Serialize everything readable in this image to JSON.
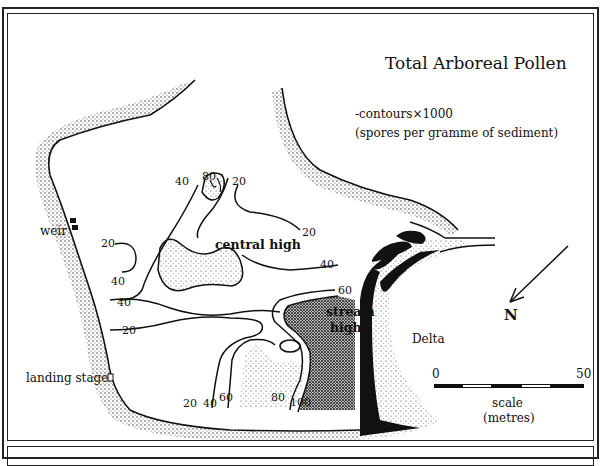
{
  "map": {
    "title": "Total Arboreal Pollen",
    "subtitle_line1": "-contours×1000",
    "subtitle_line2": "(spores per gramme of sediment)",
    "labels": {
      "weir": "weir",
      "landing_stage": "landing stage",
      "central_high": "central high",
      "stream_high_line1": "stream",
      "stream_high_line2": "high",
      "delta": "Delta"
    },
    "contour_labels": [
      {
        "id": "c40-top",
        "value": "40"
      },
      {
        "id": "c80-top",
        "value": "80"
      },
      {
        "id": "c20-top",
        "value": "20"
      },
      {
        "id": "c20-right",
        "value": "20"
      },
      {
        "id": "c20-left",
        "value": "20"
      },
      {
        "id": "c40-right",
        "value": "40"
      },
      {
        "id": "c40-left-a",
        "value": "40"
      },
      {
        "id": "c40-left-b",
        "value": "40"
      },
      {
        "id": "c60-right",
        "value": "60"
      },
      {
        "id": "c20-mid",
        "value": "20"
      },
      {
        "id": "c20-bottom",
        "value": "20"
      },
      {
        "id": "c40-bottom",
        "value": "40"
      },
      {
        "id": "c60-bottom",
        "value": "60"
      },
      {
        "id": "c80-bottom",
        "value": "80"
      },
      {
        "id": "c100-bottom",
        "value": "100"
      }
    ],
    "north_arrow": {
      "label": "N",
      "icon": "north-arrow-icon"
    },
    "scale": {
      "start": "0",
      "end": "50",
      "label_line1": "scale",
      "label_line2": "(metres)"
    }
  }
}
